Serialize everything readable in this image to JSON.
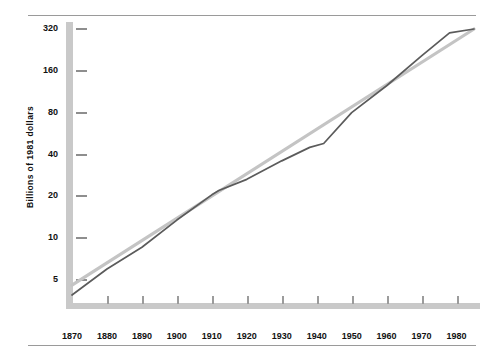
{
  "figure": {
    "has_top_rule": true,
    "has_bottom_rule": true,
    "rule_color": "#9a9a9a"
  },
  "axes": {
    "y_axis_label": "Billions of 1981 dollars",
    "y_axis_color": "#c9c9c9",
    "x_axis_color": "#c9c9c9",
    "tick_color": "#8e8e8e"
  },
  "colors": {
    "data_line": "#5b5b5b",
    "trend_line": "#c4c4c4",
    "text": "#111111",
    "background": "#ffffff"
  },
  "chart_data": {
    "type": "line",
    "title": "",
    "xlabel": "",
    "ylabel": "Billions of 1981 dollars",
    "yscale": "log",
    "ylim": [
      3.6,
      360
    ],
    "xlim": [
      1870,
      1985
    ],
    "grid": false,
    "legend": "none",
    "ytick_labels": [
      "320",
      "160",
      "80",
      "40",
      "20",
      "10",
      "5"
    ],
    "ytick_values": [
      320,
      160,
      80,
      40,
      20,
      10,
      5
    ],
    "xtick_labels": [
      "1870",
      "1880",
      "1890",
      "1900",
      "1910",
      "1920",
      "1930",
      "1940",
      "1950",
      "1960",
      "1970",
      "1980"
    ],
    "xtick_values": [
      1870,
      1880,
      1890,
      1900,
      1910,
      1920,
      1930,
      1940,
      1950,
      1960,
      1970,
      1980
    ],
    "series": [
      {
        "name": "trend",
        "style": "straight-trend",
        "color": "#c4c4c4",
        "width": 3.2,
        "x": [
          1870,
          1985
        ],
        "values": [
          4.6,
          320
        ]
      },
      {
        "name": "actual",
        "style": "data",
        "color": "#5b5b5b",
        "width": 1.7,
        "x": [
          1870,
          1880,
          1890,
          1900,
          1910,
          1912,
          1920,
          1930,
          1938,
          1942,
          1950,
          1960,
          1970,
          1978,
          1985
        ],
        "values": [
          3.9,
          6.0,
          8.6,
          13.5,
          20.5,
          22.0,
          26.5,
          36.0,
          45.0,
          48.0,
          80.0,
          125.0,
          205.0,
          300.0,
          320.0
        ]
      }
    ]
  }
}
